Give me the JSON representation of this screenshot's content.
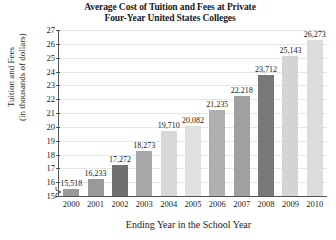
{
  "chart_data": {
    "type": "bar",
    "title": "Average Cost of Tuition and Fees at Private Four-Year United States Colleges",
    "title_line1": "Average Cost of Tuition and Fees at Private",
    "title_line2": "Four-Year United States Colleges",
    "xlabel": "Ending Year in the School Year",
    "ylabel": "Tuition and Fees (in thousands of dollars)",
    "ylabel_line1": "Tuition and Fees",
    "ylabel_line2": "(in thousands of dollars)",
    "categories": [
      "2000",
      "2001",
      "2002",
      "2003",
      "2004",
      "2005",
      "2006",
      "2007",
      "2008",
      "2009",
      "2010"
    ],
    "values": [
      15518,
      16233,
      17272,
      18273,
      19710,
      20082,
      21235,
      22218,
      23712,
      25143,
      26273
    ],
    "value_labels": [
      "15,518",
      "16,233",
      "17,272",
      "18,273",
      "19,710",
      "20,082",
      "21,235",
      "22,218",
      "23,712",
      "25,143",
      "26,273"
    ],
    "bar_colors": [
      "#9a9a9a",
      "#9a9a9a",
      "#707070",
      "#a8a8a8",
      "#d8d8d8",
      "#e0e0e0",
      "#b0b0b0",
      "#a0a0a0",
      "#787878",
      "#d4d4d4",
      "#dcdcdc"
    ],
    "ylim": [
      15000,
      27000
    ],
    "ytick_labels": [
      "27",
      "26",
      "25",
      "24",
      "23",
      "22",
      "21",
      "20",
      "19",
      "18",
      "17",
      "16",
      "15"
    ],
    "ytick_values": [
      27000,
      26000,
      25000,
      24000,
      23000,
      22000,
      21000,
      20000,
      19000,
      18000,
      17000,
      16000,
      15000
    ],
    "y_units": "thousands of dollars",
    "grid": true,
    "legend": "none",
    "axis_break": true
  }
}
